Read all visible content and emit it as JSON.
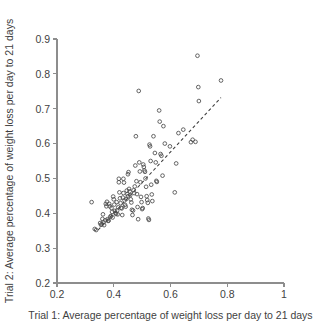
{
  "chart_data": {
    "type": "scatter",
    "title": "",
    "xlabel": "Trial 1: Average percentage of weight loss per day to 21 days",
    "ylabel": "Trial 2: Average percentage of weight loss per day to 21 days",
    "xlim": [
      0.2,
      1.0
    ],
    "ylim": [
      0.2,
      0.9
    ],
    "xticks": [
      0.2,
      0.4,
      0.6,
      0.8,
      1
    ],
    "yticks": [
      0.2,
      0.3,
      0.4,
      0.5,
      0.6,
      0.7,
      0.8,
      0.9
    ],
    "xtick_labels": [
      "0.2",
      "0.4",
      "0.6",
      "0.8",
      "1"
    ],
    "ytick_labels": [
      "0.2",
      "0.3",
      "0.4",
      "0.5",
      "0.6",
      "0.7",
      "0.8",
      "0.9"
    ],
    "grid": false,
    "legend": null,
    "marker": "open-circle",
    "marker_color": "#4a4a4a",
    "axis_color": "#8d8d8d",
    "fit_line": {
      "style": "dashed",
      "color": "#3d3d3d",
      "x_start": 0.345,
      "y_start": 0.352,
      "x_end": 0.778,
      "y_end": 0.732,
      "slope": 0.878,
      "intercept": 0.049
    },
    "points": [
      [
        0.322,
        0.432
      ],
      [
        0.333,
        0.355
      ],
      [
        0.338,
        0.352
      ],
      [
        0.352,
        0.372
      ],
      [
        0.355,
        0.367
      ],
      [
        0.358,
        0.369
      ],
      [
        0.36,
        0.384
      ],
      [
        0.362,
        0.397
      ],
      [
        0.364,
        0.374
      ],
      [
        0.366,
        0.366
      ],
      [
        0.37,
        0.38
      ],
      [
        0.372,
        0.427
      ],
      [
        0.374,
        0.42
      ],
      [
        0.376,
        0.433
      ],
      [
        0.378,
        0.383
      ],
      [
        0.38,
        0.378
      ],
      [
        0.382,
        0.379
      ],
      [
        0.384,
        0.427
      ],
      [
        0.386,
        0.42
      ],
      [
        0.388,
        0.39
      ],
      [
        0.39,
        0.392
      ],
      [
        0.392,
        0.415
      ],
      [
        0.394,
        0.404
      ],
      [
        0.396,
        0.388
      ],
      [
        0.398,
        0.448
      ],
      [
        0.4,
        0.44
      ],
      [
        0.402,
        0.425
      ],
      [
        0.404,
        0.407
      ],
      [
        0.406,
        0.401
      ],
      [
        0.408,
        0.398
      ],
      [
        0.41,
        0.432
      ],
      [
        0.412,
        0.408
      ],
      [
        0.414,
        0.397
      ],
      [
        0.416,
        0.417
      ],
      [
        0.418,
        0.499
      ],
      [
        0.418,
        0.489
      ],
      [
        0.42,
        0.46
      ],
      [
        0.422,
        0.443
      ],
      [
        0.424,
        0.429
      ],
      [
        0.426,
        0.416
      ],
      [
        0.428,
        0.414
      ],
      [
        0.43,
        0.395
      ],
      [
        0.432,
        0.445
      ],
      [
        0.434,
        0.458
      ],
      [
        0.434,
        0.499
      ],
      [
        0.436,
        0.488
      ],
      [
        0.438,
        0.437
      ],
      [
        0.44,
        0.424
      ],
      [
        0.442,
        0.419
      ],
      [
        0.444,
        0.441
      ],
      [
        0.446,
        0.465
      ],
      [
        0.448,
        0.455
      ],
      [
        0.45,
        0.449
      ],
      [
        0.45,
        0.512
      ],
      [
        0.452,
        0.518
      ],
      [
        0.454,
        0.47
      ],
      [
        0.456,
        0.463
      ],
      [
        0.458,
        0.452
      ],
      [
        0.46,
        0.44
      ],
      [
        0.462,
        0.431
      ],
      [
        0.464,
        0.41
      ],
      [
        0.466,
        0.395
      ],
      [
        0.468,
        0.408
      ],
      [
        0.47,
        0.466
      ],
      [
        0.472,
        0.458
      ],
      [
        0.474,
        0.477
      ],
      [
        0.476,
        0.537
      ],
      [
        0.478,
        0.621
      ],
      [
        0.48,
        0.492
      ],
      [
        0.482,
        0.455
      ],
      [
        0.484,
        0.418
      ],
      [
        0.486,
        0.383
      ],
      [
        0.488,
        0.751
      ],
      [
        0.49,
        0.546
      ],
      [
        0.492,
        0.52
      ],
      [
        0.494,
        0.489
      ],
      [
        0.496,
        0.447
      ],
      [
        0.498,
        0.432
      ],
      [
        0.5,
        0.412
      ],
      [
        0.502,
        0.415
      ],
      [
        0.504,
        0.54
      ],
      [
        0.506,
        0.533
      ],
      [
        0.508,
        0.523
      ],
      [
        0.51,
        0.519
      ],
      [
        0.512,
        0.5
      ],
      [
        0.514,
        0.476
      ],
      [
        0.516,
        0.449
      ],
      [
        0.518,
        0.438
      ],
      [
        0.52,
        0.43
      ],
      [
        0.522,
        0.385
      ],
      [
        0.524,
        0.381
      ],
      [
        0.526,
        0.597
      ],
      [
        0.528,
        0.592
      ],
      [
        0.53,
        0.55
      ],
      [
        0.532,
        0.482
      ],
      [
        0.534,
        0.454
      ],
      [
        0.536,
        0.435
      ],
      [
        0.54,
        0.621
      ],
      [
        0.545,
        0.573
      ],
      [
        0.548,
        0.546
      ],
      [
        0.55,
        0.493
      ],
      [
        0.552,
        0.49
      ],
      [
        0.56,
        0.695
      ],
      [
        0.562,
        0.663
      ],
      [
        0.565,
        0.57
      ],
      [
        0.568,
        0.565
      ],
      [
        0.572,
        0.508
      ],
      [
        0.575,
        0.65
      ],
      [
        0.58,
        0.6
      ],
      [
        0.598,
        0.592
      ],
      [
        0.615,
        0.46
      ],
      [
        0.62,
        0.543
      ],
      [
        0.628,
        0.63
      ],
      [
        0.645,
        0.64
      ],
      [
        0.672,
        0.604
      ],
      [
        0.678,
        0.611
      ],
      [
        0.688,
        0.605
      ],
      [
        0.695,
        0.852
      ],
      [
        0.698,
        0.762
      ],
      [
        0.7,
        0.722
      ],
      [
        0.778,
        0.781
      ]
    ]
  }
}
